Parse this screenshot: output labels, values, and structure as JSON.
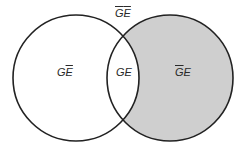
{
  "diagram": {
    "type": "venn",
    "sets": [
      "G",
      "E"
    ],
    "colors": {
      "stroke": "#222222",
      "shade": "#cfcfcf",
      "background": "#ffffff"
    },
    "shaded_region": "not-G and E",
    "regions": {
      "outside": {
        "g": "G",
        "e": "E",
        "g_bar": true,
        "e_bar": true
      },
      "left_only": {
        "g": "G",
        "e": "E",
        "g_bar": false,
        "e_bar": true
      },
      "intersection": {
        "g": "G",
        "e": "E",
        "g_bar": false,
        "e_bar": false
      },
      "right_only": {
        "g": "G",
        "e": "E",
        "g_bar": true,
        "e_bar": false
      }
    }
  }
}
